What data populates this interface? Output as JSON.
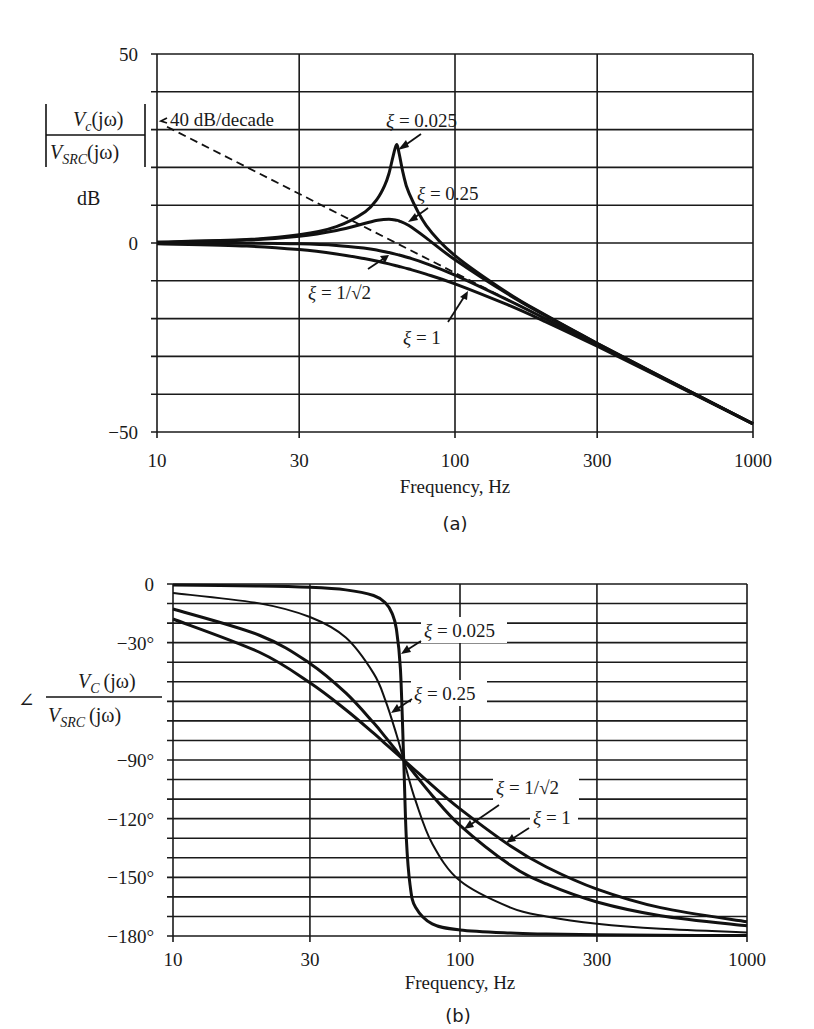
{
  "chart_data": [
    {
      "id": "magnitude",
      "type": "line",
      "caption": "(a)",
      "title": "",
      "xlabel": "Frequency, Hz",
      "ylabel_numerator": "V",
      "ylabel_numerator_sub": "c",
      "ylabel_numerator_arg": "(jω)",
      "ylabel_denominator": "V",
      "ylabel_denominator_sub": "SRC",
      "ylabel_denominator_arg": "(jω)",
      "ylabel_unit": "dB",
      "xscale": "log",
      "xlim": [
        10,
        1000
      ],
      "ylim": [
        -50,
        50
      ],
      "xticks": [
        10,
        30,
        100,
        300,
        1000
      ],
      "xtick_labels": [
        "10",
        "30",
        "100",
        "300",
        "1000"
      ],
      "yticks": [
        50,
        0,
        -50
      ],
      "ytick_labels": [
        "50",
        "0",
        "−50"
      ],
      "grid": {
        "x": [
          10,
          30,
          100,
          300,
          1000
        ],
        "y_step": 10
      },
      "asymptote": {
        "label": "40 dB/decade",
        "x": [
          10,
          1000
        ],
        "y": [
          32.1,
          -47.9
        ],
        "style": "dashed"
      },
      "series": [
        {
          "name": "ξ = 0.025",
          "label": "ξ = 0.025",
          "x": [
            10,
            20,
            30,
            40,
            50,
            55,
            58,
            60,
            62,
            63.66,
            65,
            67,
            70,
            80,
            100,
            150,
            200,
            300,
            500,
            1000
          ],
          "y": [
            0.22,
            0.9,
            2.18,
            4.35,
            8.29,
            11.8,
            15.09,
            18.33,
            22.99,
            26.02,
            23.55,
            18.42,
            13.3,
            4.69,
            -3.34,
            -13.17,
            -18.96,
            -26.53,
            -35.66,
            -47.81
          ]
        },
        {
          "name": "ξ = 0.25",
          "label": "ξ = 0.25",
          "x": [
            10,
            20,
            30,
            40,
            50,
            55,
            60,
            63.66,
            65,
            70,
            80,
            100,
            150,
            200,
            300,
            500,
            1000
          ],
          "y": [
            0.19,
            0.77,
            1.8,
            3.33,
            5.21,
            6.01,
            6.3,
            6.02,
            5.81,
            4.61,
            1.36,
            -4.43,
            -13.45,
            -19.09,
            -26.58,
            -35.68,
            -47.81
          ]
        },
        {
          "name": "ξ = 1/√2",
          "label": "ξ = 1/√2",
          "x": [
            10,
            20,
            30,
            40,
            50,
            55,
            60,
            63.66,
            65,
            70,
            80,
            100,
            150,
            200,
            300,
            500,
            1000
          ],
          "y": [
            0.0,
            -0.04,
            -0.21,
            -0.63,
            -1.4,
            -1.92,
            -2.53,
            -3.01,
            -3.19,
            -3.91,
            -5.43,
            -8.5,
            -15.03,
            -19.93,
            -26.94,
            -35.81,
            -47.85
          ]
        },
        {
          "name": "ξ = 1",
          "label": "ξ = 1",
          "x": [
            10,
            20,
            30,
            40,
            50,
            55,
            60,
            63.66,
            65,
            70,
            80,
            100,
            150,
            200,
            300,
            500,
            1000
          ],
          "y": [
            -0.21,
            -0.82,
            -1.74,
            -2.89,
            -4.17,
            -4.84,
            -5.52,
            -6.02,
            -6.2,
            -6.88,
            -8.23,
            -10.8,
            -16.33,
            -20.72,
            -27.31,
            -35.94,
            -47.85
          ]
        }
      ]
    },
    {
      "id": "phase",
      "type": "line",
      "caption": "(b)",
      "title": "",
      "xlabel": "Frequency, Hz",
      "ylabel_prefix": "∠",
      "ylabel_numerator": "V",
      "ylabel_numerator_sub": "C",
      "ylabel_numerator_arg": "(jω)",
      "ylabel_denominator": "V",
      "ylabel_denominator_sub": "SRC",
      "ylabel_denominator_arg": "(jω)",
      "xscale": "log",
      "xlim": [
        10,
        1000
      ],
      "ylim": [
        -180,
        0
      ],
      "xticks": [
        10,
        30,
        100,
        300,
        1000
      ],
      "xtick_labels": [
        "10",
        "30",
        "100",
        "300",
        "1000"
      ],
      "yticks": [
        0,
        -30,
        -90,
        -120,
        -150,
        -180
      ],
      "ytick_labels": [
        "0",
        "−30°",
        "−90°",
        "−120°",
        "−150°",
        "−180°"
      ],
      "grid": {
        "x": [
          10,
          30,
          100,
          300,
          1000
        ],
        "y_step": 10
      },
      "series": [
        {
          "name": "ξ = 0.025",
          "label": "ξ = 0.025",
          "x": [
            10,
            20,
            30,
            40,
            50,
            55,
            58,
            60,
            62,
            63.66,
            65,
            67,
            70,
            80,
            100,
            150,
            200,
            300,
            500,
            1000
          ],
          "y": [
            -0.5,
            -1.0,
            -1.7,
            -3.0,
            -5.9,
            -9.7,
            -15.0,
            -22.9,
            -43.4,
            -90.0,
            -129.8,
            -154.0,
            -165.3,
            -173.8,
            -176.9,
            -178.5,
            -179.0,
            -179.4,
            -179.6,
            -179.8
          ]
        },
        {
          "name": "ξ = 0.25",
          "label": "ξ = 0.25",
          "x": [
            10,
            20,
            30,
            40,
            50,
            55,
            60,
            63.66,
            65,
            70,
            80,
            100,
            150,
            200,
            300,
            500,
            1000
          ],
          "y": [
            -4.6,
            -9.9,
            -16.9,
            -27.4,
            -45.7,
            -59.6,
            -76.7,
            -90.0,
            -94.8,
            -110.8,
            -132.7,
            -151.8,
            -165.5,
            -170.0,
            -173.7,
            -176.3,
            -178.2
          ]
        },
        {
          "name": "ξ = 1/√2",
          "label": "ξ = 1/√2",
          "x": [
            10,
            20,
            30,
            40,
            50,
            55,
            60,
            63.66,
            65,
            70,
            80,
            100,
            150,
            200,
            300,
            500,
            1000
          ],
          "y": [
            -12.8,
            -26.2,
            -40.6,
            -55.7,
            -71.0,
            -78.3,
            -85.2,
            -90.0,
            -91.7,
            -97.7,
            -108.1,
            -123.4,
            -143.8,
            -153.4,
            -162.6,
            -169.6,
            -174.8
          ]
        },
        {
          "name": "ξ = 1",
          "label": "ξ = 1",
          "x": [
            10,
            20,
            30,
            40,
            50,
            55,
            60,
            63.66,
            65,
            70,
            80,
            100,
            150,
            200,
            300,
            500,
            1000
          ],
          "y": [
            -17.9,
            -34.9,
            -50.5,
            -64.3,
            -76.3,
            -81.7,
            -86.6,
            -90.0,
            -91.2,
            -95.4,
            -103.0,
            -115.0,
            -134.0,
            -144.7,
            -156.0,
            -165.5,
            -172.7
          ]
        }
      ]
    }
  ]
}
